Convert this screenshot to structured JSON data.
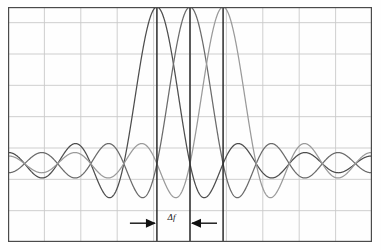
{
  "figure": {
    "name": "ofdm-subcarrier-spectra",
    "background": "#fefefe",
    "border_color": "#4a4a4a",
    "grid_color": "#c9c9c9"
  },
  "annotations": {
    "delta_f_label": "Δf",
    "left_arrow_name": "arrow-right-icon",
    "right_arrow_name": "arrow-left-icon",
    "arrow_color": "#111111"
  },
  "chart_data": {
    "type": "line",
    "title": "",
    "subtitle": "",
    "xlabel": "",
    "ylabel": "",
    "grid": true,
    "legend_position": "none",
    "xlim": [
      -5.5,
      5.5
    ],
    "ylim": [
      -0.5,
      1.0
    ],
    "x_gridlines": [
      -5.5,
      -4.4,
      -3.3,
      -2.2,
      -1.1,
      0.0,
      1.1,
      2.2,
      3.3,
      4.4,
      5.5
    ],
    "y_gridlines": [
      -0.5,
      -0.3,
      -0.1,
      0.1,
      0.3,
      0.5,
      0.7,
      0.9
    ],
    "baseline_y": 0,
    "function": "sinc",
    "subcarrier_spacing": 1.0,
    "peak_value": 1.0,
    "series": [
      {
        "name": "subcarrier-1",
        "color": "#4d4d4d",
        "center": -1.0,
        "peak_x": -1.0,
        "peak_y": 1.0,
        "zeros": [
          -5,
          -4,
          -3,
          -2,
          0,
          1,
          2,
          3,
          4,
          5
        ],
        "x": [
          -5.5,
          -5.25,
          -5,
          -4.75,
          -4.5,
          -4.25,
          -4,
          -3.75,
          -3.5,
          -3.25,
          -3,
          -2.75,
          -2.5,
          -2.25,
          -2,
          -1.75,
          -1.5,
          -1.25,
          -1,
          -0.75,
          -0.5,
          -0.25,
          0,
          0.25,
          0.5,
          0.75,
          1,
          1.25,
          1.5,
          1.75,
          2,
          2.25,
          2.5,
          2.75,
          3,
          3.25,
          3.5,
          3.75,
          4,
          4.25,
          4.5,
          4.75,
          5,
          5.25,
          5.5
        ],
        "y": [
          0.0,
          0.084,
          0.0,
          -0.093,
          0.0,
          0.105,
          0.0,
          -0.121,
          0.0,
          0.143,
          0.0,
          -0.177,
          0.0,
          0.234,
          0.0,
          -0.35,
          0.0,
          0.707,
          1.0,
          0.707,
          0.0,
          -0.3,
          0.0,
          0.18,
          0.0,
          -0.129,
          0.0,
          0.1,
          0.0,
          -0.082,
          0.0,
          0.069,
          0.0,
          -0.06,
          0.0,
          0.053,
          0.0,
          -0.047,
          0.0,
          0.043,
          0.0,
          -0.039,
          0.0,
          0.036,
          0.0
        ]
      },
      {
        "name": "subcarrier-2",
        "color": "#6b6b6b",
        "center": 0.0,
        "peak_x": 0.0,
        "peak_y": 1.0,
        "zeros": [
          -5,
          -4,
          -3,
          -2,
          -1,
          1,
          2,
          3,
          4,
          5
        ],
        "x": [
          -5.5,
          -5.25,
          -5,
          -4.75,
          -4.5,
          -4.25,
          -4,
          -3.75,
          -3.5,
          -3.25,
          -3,
          -2.75,
          -2.5,
          -2.25,
          -2,
          -1.75,
          -1.5,
          -1.25,
          -1,
          -0.75,
          -0.5,
          -0.25,
          0,
          0.25,
          0.5,
          0.75,
          1,
          1.25,
          1.5,
          1.75,
          2,
          2.25,
          2.5,
          2.75,
          3,
          3.25,
          3.5,
          3.75,
          4,
          4.25,
          4.5,
          4.75,
          5,
          5.25,
          5.5
        ],
        "y": [
          0.0,
          -0.077,
          0.0,
          0.084,
          0.0,
          -0.093,
          0.0,
          0.105,
          0.0,
          -0.121,
          0.0,
          0.143,
          0.0,
          -0.177,
          0.0,
          0.234,
          0.0,
          -0.35,
          0.0,
          0.707,
          1.0,
          0.707,
          0.0,
          -0.3,
          0.0,
          0.18,
          0.0,
          -0.129,
          0.0,
          0.1,
          0.0,
          -0.082,
          0.0,
          0.069,
          0.0,
          -0.06,
          0.0,
          0.053,
          0.0,
          -0.047,
          0.0,
          0.043,
          0.0,
          -0.039,
          0.0
        ]
      },
      {
        "name": "subcarrier-3",
        "color": "#9a9a9a",
        "center": 1.0,
        "peak_x": 1.0,
        "peak_y": 1.0,
        "zeros": [
          -5,
          -4,
          -3,
          -2,
          -1,
          0,
          2,
          3,
          4,
          5
        ],
        "x": [
          -5.5,
          -5.25,
          -5,
          -4.75,
          -4.5,
          -4.25,
          -4,
          -3.75,
          -3.5,
          -3.25,
          -3,
          -2.75,
          -2.5,
          -2.25,
          -2,
          -1.75,
          -1.5,
          -1.25,
          -1,
          -0.75,
          -0.5,
          -0.25,
          0,
          0.25,
          0.5,
          0.75,
          1,
          1.25,
          1.5,
          1.75,
          2,
          2.25,
          2.5,
          2.75,
          3,
          3.25,
          3.5,
          3.75,
          4,
          4.25,
          4.5,
          4.75,
          5,
          5.25,
          5.5
        ],
        "y": [
          0.0,
          0.072,
          0.0,
          -0.077,
          0.0,
          0.084,
          0.0,
          -0.093,
          0.0,
          0.105,
          0.0,
          -0.121,
          0.0,
          0.143,
          0.0,
          -0.177,
          0.0,
          0.234,
          0.0,
          -0.35,
          0.0,
          0.707,
          1.0,
          0.707,
          0.0,
          -0.3,
          0.0,
          0.18,
          0.0,
          -0.129,
          0.0,
          0.1,
          0.0,
          -0.082,
          0.0,
          0.069,
          0.0,
          -0.06,
          0.0,
          0.053,
          0.0,
          -0.047,
          0.0,
          0.043,
          0.0
        ]
      }
    ],
    "markers": [
      {
        "name": "peak-marker-1",
        "x": -1.0,
        "color": "#2b2b2b"
      },
      {
        "name": "peak-marker-2",
        "x": 0.0,
        "color": "#2b2b2b"
      },
      {
        "name": "peak-marker-3",
        "x": 1.0,
        "color": "#2b2b2b"
      }
    ],
    "annotation": {
      "label": "Δf",
      "from_x": -1.0,
      "to_x": 0.0,
      "y": -0.38
    }
  }
}
